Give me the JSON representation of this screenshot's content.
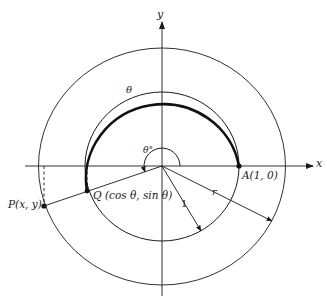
{
  "diagram": {
    "type": "unit-circle-polar-coordinates",
    "colors": {
      "stroke": "#1a1a1a",
      "background": "#ffffff"
    },
    "axes": {
      "x_label": "x",
      "y_label": "y"
    },
    "circles": [
      {
        "name": "unit-circle",
        "radius_label": "1"
      },
      {
        "name": "outer-circle",
        "radius_label": "r"
      }
    ],
    "angle": {
      "arc_label": "θ",
      "degree_label": "θ°"
    },
    "points": {
      "A": {
        "label": "A(1, 0)"
      },
      "Q": {
        "label": "Q (cos θ,  sin θ)"
      },
      "P": {
        "label": "P(x, y)"
      }
    }
  }
}
